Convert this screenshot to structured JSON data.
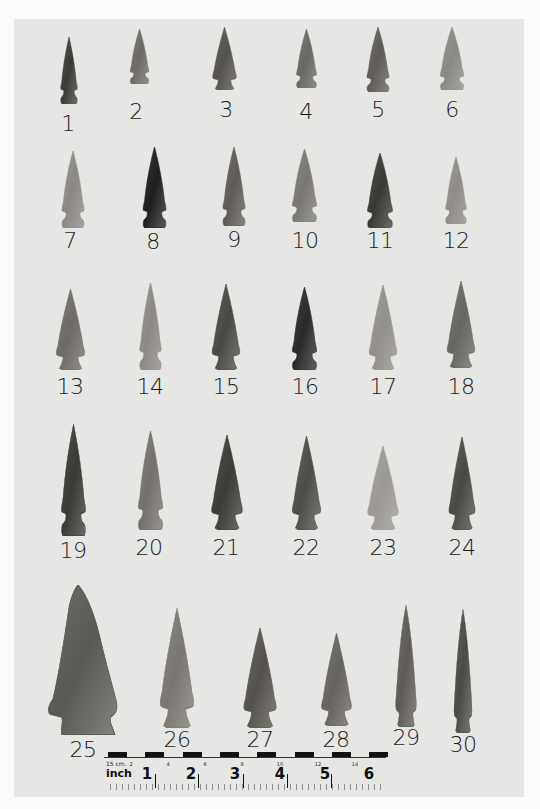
{
  "image": {
    "description": "Photographic plate of 30 chipped-stone projectile points (arrowheads) arranged in five rows on a gray background, each numbered, with a metric/inch scale bar at the bottom",
    "background_color": "#e6e6e4",
    "border_color": "#fbfbfb"
  },
  "points": [
    {
      "id": 1,
      "label": "1",
      "box": [
        57,
        37,
        24,
        67
      ],
      "label_pos": [
        68,
        113
      ],
      "tone": "#3b3a37",
      "shape": "side-notched"
    },
    {
      "id": 2,
      "label": "2",
      "box": [
        126,
        29,
        27,
        55
      ],
      "label_pos": [
        136,
        101
      ],
      "tone": "#6e6b66",
      "shape": "side-notched"
    },
    {
      "id": 3,
      "label": "3",
      "box": [
        209,
        27,
        31,
        63
      ],
      "label_pos": [
        226,
        99
      ],
      "tone": "#55524d",
      "shape": "corner-notched"
    },
    {
      "id": 4,
      "label": "4",
      "box": [
        292,
        29,
        29,
        59
      ],
      "label_pos": [
        306,
        101
      ],
      "tone": "#6a6863",
      "shape": "side-notched"
    },
    {
      "id": 5,
      "label": "5",
      "box": [
        362,
        27,
        32,
        65
      ],
      "label_pos": [
        378,
        99
      ],
      "tone": "#5f5c57",
      "shape": "side-notched"
    },
    {
      "id": 6,
      "label": "6",
      "box": [
        435,
        27,
        34,
        63
      ],
      "label_pos": [
        452,
        99
      ],
      "tone": "#8a8883",
      "shape": "side-notched"
    },
    {
      "id": 7,
      "label": "7",
      "box": [
        57,
        151,
        32,
        77
      ],
      "label_pos": [
        70,
        230
      ],
      "tone": "#8b8883",
      "shape": "side-notched"
    },
    {
      "id": 8,
      "label": "8",
      "box": [
        138,
        147,
        33,
        81
      ],
      "label_pos": [
        153,
        231
      ],
      "tone": "#1f1e1c",
      "shape": "side-notched"
    },
    {
      "id": 9,
      "label": "9",
      "box": [
        218,
        147,
        32,
        79
      ],
      "label_pos": [
        234,
        229
      ],
      "tone": "#5e5b56",
      "shape": "side-notched"
    },
    {
      "id": 10,
      "label": "10",
      "box": [
        287,
        149,
        35,
        73
      ],
      "label_pos": [
        305,
        230
      ],
      "tone": "#7a7772",
      "shape": "side-notched"
    },
    {
      "id": 11,
      "label": "11",
      "box": [
        362,
        153,
        36,
        75
      ],
      "label_pos": [
        380,
        230
      ],
      "tone": "#3a3835",
      "shape": "side-notched"
    },
    {
      "id": 12,
      "label": "12",
      "box": [
        441,
        157,
        30,
        67
      ],
      "label_pos": [
        456,
        230
      ],
      "tone": "#8f8c87",
      "shape": "side-notched"
    },
    {
      "id": 13,
      "label": "13",
      "box": [
        52,
        289,
        37,
        81
      ],
      "label_pos": [
        70,
        376
      ],
      "tone": "#6e6b66",
      "shape": "corner-notched"
    },
    {
      "id": 14,
      "label": "14",
      "box": [
        135,
        283,
        31,
        87
      ],
      "label_pos": [
        150,
        376
      ],
      "tone": "#8c8984",
      "shape": "side-notched"
    },
    {
      "id": 15,
      "label": "15",
      "box": [
        208,
        284,
        36,
        86
      ],
      "label_pos": [
        226,
        376
      ],
      "tone": "#4a4844",
      "shape": "corner-notched"
    },
    {
      "id": 16,
      "label": "16",
      "box": [
        287,
        287,
        35,
        83
      ],
      "label_pos": [
        305,
        376
      ],
      "tone": "#2a2927",
      "shape": "side-notched"
    },
    {
      "id": 17,
      "label": "17",
      "box": [
        365,
        285,
        36,
        85
      ],
      "label_pos": [
        383,
        376
      ],
      "tone": "#93908b",
      "shape": "corner-notched"
    },
    {
      "id": 18,
      "label": "18",
      "box": [
        443,
        281,
        36,
        87
      ],
      "label_pos": [
        461,
        376
      ],
      "tone": "#676560",
      "shape": "corner-notched"
    },
    {
      "id": 19,
      "label": "19",
      "box": [
        56,
        424,
        35,
        112
      ],
      "label_pos": [
        73,
        540
      ],
      "tone": "#3a3835",
      "shape": "side-notched"
    },
    {
      "id": 20,
      "label": "20",
      "box": [
        133,
        431,
        35,
        99
      ],
      "label_pos": [
        149,
        537
      ],
      "tone": "#74716c",
      "shape": "side-notched"
    },
    {
      "id": 21,
      "label": "21",
      "box": [
        207,
        435,
        40,
        95
      ],
      "label_pos": [
        226,
        537
      ],
      "tone": "#3c3a37",
      "shape": "corner-notched"
    },
    {
      "id": 22,
      "label": "22",
      "box": [
        288,
        436,
        37,
        94
      ],
      "label_pos": [
        306,
        537
      ],
      "tone": "#4e4c48",
      "shape": "corner-notched"
    },
    {
      "id": 23,
      "label": "23",
      "box": [
        363,
        446,
        40,
        84
      ],
      "label_pos": [
        383,
        537
      ],
      "tone": "#9c9994",
      "shape": "corner-notched"
    },
    {
      "id": 24,
      "label": "24",
      "box": [
        445,
        437,
        34,
        93
      ],
      "label_pos": [
        462,
        537
      ],
      "tone": "#4a4844",
      "shape": "corner-notched"
    },
    {
      "id": 25,
      "label": "25",
      "box": [
        47,
        585,
        74,
        150
      ],
      "label_pos": [
        83,
        739
      ],
      "tone": "#5a5853",
      "shape": "large-corner-notched"
    },
    {
      "id": 26,
      "label": "26",
      "box": [
        155,
        608,
        44,
        120
      ],
      "label_pos": [
        177,
        729
      ],
      "tone": "#7a7772",
      "shape": "corner-notched"
    },
    {
      "id": 27,
      "label": "27",
      "box": [
        239,
        628,
        42,
        100
      ],
      "label_pos": [
        260,
        729
      ],
      "tone": "#55524d",
      "shape": "corner-notched"
    },
    {
      "id": 28,
      "label": "28",
      "box": [
        317,
        633,
        39,
        93
      ],
      "label_pos": [
        336,
        729
      ],
      "tone": "#66635e",
      "shape": "corner-notched"
    },
    {
      "id": 29,
      "label": "29",
      "box": [
        390,
        605,
        32,
        122
      ],
      "label_pos": [
        406,
        727
      ],
      "tone": "#5e5b56",
      "shape": "lanceolate-notched"
    },
    {
      "id": 30,
      "label": "30",
      "box": [
        449,
        609,
        28,
        124
      ],
      "label_pos": [
        463,
        734
      ],
      "tone": "#4c4a46",
      "shape": "lanceolate-notched"
    }
  ],
  "scale_bar": {
    "cm_label": "15 cm.",
    "cm_ticks": [
      "2",
      "4",
      "6",
      "8",
      "10",
      "12",
      "14"
    ],
    "inch_label": "inch",
    "inch_ticks": [
      "1",
      "2",
      "3",
      "4",
      "5",
      "6"
    ]
  }
}
